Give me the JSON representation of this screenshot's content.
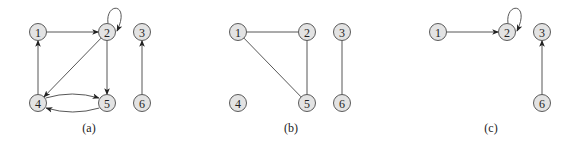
{
  "figure": {
    "panels": [
      {
        "id": "a",
        "caption": "(a)",
        "caption_pos": [
          89,
          132
        ],
        "directed": true,
        "nodes": [
          {
            "id": "1",
            "label": "1",
            "x": 38,
            "y": 32
          },
          {
            "id": "2",
            "label": "2",
            "x": 107,
            "y": 32
          },
          {
            "id": "3",
            "label": "3",
            "x": 142,
            "y": 32
          },
          {
            "id": "4",
            "label": "4",
            "x": 38,
            "y": 103
          },
          {
            "id": "5",
            "label": "5",
            "x": 107,
            "y": 103
          },
          {
            "id": "6",
            "label": "6",
            "x": 142,
            "y": 103
          }
        ],
        "edges": [
          {
            "from": "1",
            "to": "2",
            "type": "straight"
          },
          {
            "from": "2",
            "to": "2",
            "type": "self-loop"
          },
          {
            "from": "2",
            "to": "4",
            "type": "straight"
          },
          {
            "from": "2",
            "to": "5",
            "type": "straight"
          },
          {
            "from": "4",
            "to": "1",
            "type": "straight"
          },
          {
            "from": "4",
            "to": "5",
            "type": "curve-up"
          },
          {
            "from": "5",
            "to": "4",
            "type": "curve-down"
          },
          {
            "from": "6",
            "to": "3",
            "type": "straight"
          }
        ]
      },
      {
        "id": "b",
        "caption": "(b)",
        "caption_pos": [
          291,
          132
        ],
        "directed": false,
        "nodes": [
          {
            "id": "1",
            "label": "1",
            "x": 238,
            "y": 32
          },
          {
            "id": "2",
            "label": "2",
            "x": 307,
            "y": 32
          },
          {
            "id": "3",
            "label": "3",
            "x": 342,
            "y": 32
          },
          {
            "id": "4",
            "label": "4",
            "x": 238,
            "y": 103
          },
          {
            "id": "5",
            "label": "5",
            "x": 307,
            "y": 103
          },
          {
            "id": "6",
            "label": "6",
            "x": 342,
            "y": 103
          }
        ],
        "edges": [
          {
            "from": "1",
            "to": "2",
            "type": "straight"
          },
          {
            "from": "1",
            "to": "5",
            "type": "straight"
          },
          {
            "from": "2",
            "to": "5",
            "type": "straight"
          },
          {
            "from": "3",
            "to": "6",
            "type": "straight"
          }
        ]
      },
      {
        "id": "c",
        "caption": "(c)",
        "caption_pos": [
          491,
          132
        ],
        "directed": true,
        "nodes": [
          {
            "id": "1",
            "label": "1",
            "x": 438,
            "y": 32
          },
          {
            "id": "2",
            "label": "2",
            "x": 507,
            "y": 32
          },
          {
            "id": "3",
            "label": "3",
            "x": 542,
            "y": 32
          },
          {
            "id": "6",
            "label": "6",
            "x": 542,
            "y": 103
          }
        ],
        "edges": [
          {
            "from": "1",
            "to": "2",
            "type": "straight"
          },
          {
            "from": "2",
            "to": "2",
            "type": "self-loop"
          },
          {
            "from": "6",
            "to": "3",
            "type": "straight"
          }
        ]
      }
    ],
    "style": {
      "node_radius": 8.5,
      "node_fill": "#e3e3e3",
      "node_stroke": "#5a5a5a",
      "edge_color": "#444444"
    }
  }
}
